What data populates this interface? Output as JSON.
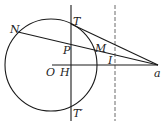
{
  "diagram": {
    "type": "geometry",
    "stroke_color": "#1a1a1a",
    "labels": {
      "N": "N",
      "T": "T",
      "P": "P",
      "M": "M",
      "O": "O",
      "H": "H",
      "I": "I",
      "a": "a",
      "T_prime": "T′"
    },
    "points": {
      "O": [
        52,
        65
      ],
      "H": [
        71,
        65
      ],
      "T": [
        71,
        24
      ],
      "T_prime": [
        71,
        106
      ],
      "N": [
        18,
        32
      ],
      "M": [
        93,
        50
      ],
      "P": [
        71,
        45
      ],
      "I": [
        115,
        58
      ],
      "a": [
        158,
        65
      ]
    },
    "circle": {
      "cx": 51,
      "cy": 65,
      "r": 46
    }
  }
}
